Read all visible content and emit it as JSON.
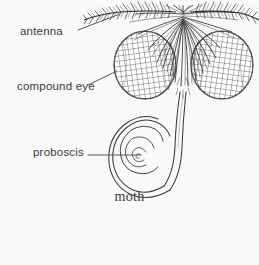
{
  "figure": {
    "caption": "moth",
    "background_color": "#f9f9fa",
    "ink_color": "#2e2e32",
    "text_color": "#3a3a3e",
    "labels": [
      {
        "id": "antenna",
        "text": "antenna",
        "leader_from": [
          78,
          30
        ],
        "leader_to": [
          120,
          14
        ]
      },
      {
        "id": "compound-eye",
        "text": "compound eye",
        "leader_from": [
          88,
          85
        ],
        "leader_to": [
          117,
          71
        ]
      },
      {
        "id": "proboscis",
        "text": "proboscis",
        "leader_from": [
          88,
          155
        ],
        "leader_to": [
          141,
          155
        ]
      }
    ],
    "parts": [
      {
        "id": "antenna-left",
        "name": "left feathered antenna"
      },
      {
        "id": "antenna-right",
        "name": "right feathered antenna"
      },
      {
        "id": "head-scales",
        "name": "furry head scales"
      },
      {
        "id": "compound-eye-left",
        "name": "left compound eye"
      },
      {
        "id": "compound-eye-right",
        "name": "right compound eye"
      },
      {
        "id": "proboscis-coil",
        "name": "coiled proboscis"
      }
    ]
  }
}
